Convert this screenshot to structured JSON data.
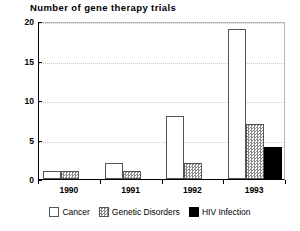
{
  "chart_data": {
    "type": "bar",
    "title": "Number of gene therapy trials",
    "xlabel": "",
    "ylabel": "",
    "categories": [
      "1990",
      "1991",
      "1992",
      "1993"
    ],
    "series": [
      {
        "name": "Cancer",
        "values": [
          1,
          2,
          8,
          19
        ],
        "color": "#ffffff",
        "pattern": "solid-white"
      },
      {
        "name": "Genetic Disorders",
        "values": [
          1,
          1,
          2,
          7
        ],
        "color": "#8a8a8a",
        "pattern": "checker"
      },
      {
        "name": "HIV Infection",
        "values": [
          0,
          0,
          0,
          4
        ],
        "color": "#000000",
        "pattern": "solid-black"
      }
    ],
    "ylim": [
      0,
      20
    ],
    "yticks": [
      0,
      5,
      10,
      15,
      20
    ],
    "ytick_labels": [
      "0",
      "5",
      "10",
      "15",
      "20"
    ],
    "grid": true,
    "grid_axis": "y",
    "legend_position": "bottom"
  },
  "legend": {
    "items": [
      {
        "label": "Cancer"
      },
      {
        "label": "Genetic Disorders"
      },
      {
        "label": "HIV Infection"
      }
    ]
  }
}
